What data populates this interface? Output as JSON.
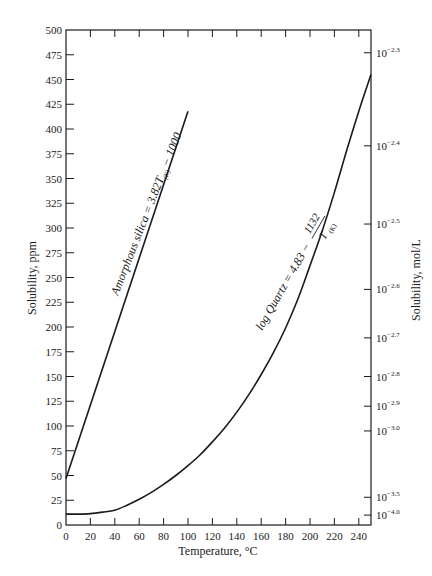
{
  "chart_data": {
    "type": "line",
    "title": "",
    "xlabel": "Temperature, °C",
    "ylabel": "Solubility, ppm",
    "ylabel_right": "Solubility, mol/L",
    "xlim": [
      0,
      250
    ],
    "ylim": [
      0,
      500
    ],
    "grid": false,
    "x_ticks": [
      0,
      20,
      40,
      60,
      80,
      100,
      120,
      140,
      160,
      180,
      200,
      220,
      240
    ],
    "y_ticks": [
      0,
      25,
      50,
      75,
      100,
      125,
      150,
      175,
      200,
      225,
      250,
      275,
      300,
      325,
      350,
      375,
      400,
      425,
      450,
      475,
      500
    ],
    "y_right_ticks": [
      {
        "label": "10",
        "exp": "−2.3",
        "ppm": 477
      },
      {
        "label": "10",
        "exp": "−2.4",
        "ppm": 383
      },
      {
        "label": "10",
        "exp": "−2.5",
        "ppm": 304
      },
      {
        "label": "10",
        "exp": "−2.6",
        "ppm": 238
      },
      {
        "label": "10",
        "exp": "−2.7",
        "ppm": 189
      },
      {
        "label": "10",
        "exp": "−2.8",
        "ppm": 150
      },
      {
        "label": "10",
        "exp": "−2.9",
        "ppm": 120
      },
      {
        "label": "10",
        "exp": "−3.0",
        "ppm": 95
      },
      {
        "label": "10",
        "exp": "−3.5",
        "ppm": 28
      },
      {
        "label": "10",
        "exp": "−4.0",
        "ppm": 10
      }
    ],
    "series": [
      {
        "name": "Amorphous silica",
        "annotation": "Amorphous silica = 3.82T(K) − 1000",
        "x": [
          0,
          100
        ],
        "values": [
          47,
          418
        ]
      },
      {
        "name": "Quartz",
        "annotation": "log Quartz = 4.83 − 1132 / T(K)",
        "x": [
          0,
          10,
          20,
          30,
          40,
          50,
          60,
          70,
          80,
          90,
          100,
          110,
          120,
          130,
          140,
          150,
          160,
          170,
          180,
          190,
          200,
          210,
          220,
          230,
          240,
          250
        ],
        "values": [
          11,
          11,
          11.5,
          13,
          15,
          20,
          26,
          33,
          41,
          50,
          60,
          71,
          84,
          98,
          114,
          132,
          152,
          174,
          199,
          228,
          262,
          297,
          336,
          378,
          418,
          455
        ]
      }
    ]
  },
  "labels": {
    "xlabel": "Temperature, °C",
    "ylabel": "Solubility, ppm",
    "ylabel_right": "Solubility, mol/L",
    "amorphous_prefix": "Amorphous silica = 3.82",
    "amorphous_T": "T",
    "amorphous_sub": "(K)",
    "amorphous_suffix": " − 1000",
    "quartz_prefix": "log Quartz = 4.83 −",
    "quartz_num": "1132",
    "quartz_den": "T",
    "quartz_den_sub": "(K)"
  }
}
